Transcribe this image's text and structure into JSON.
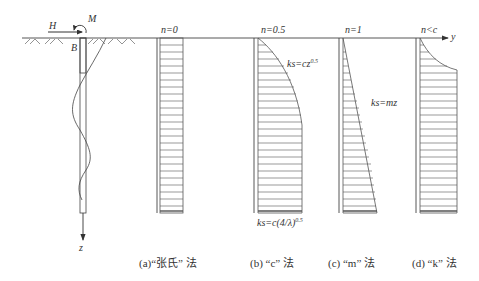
{
  "figure": {
    "type": "pile-soil subgrade reaction distribution diagram",
    "axes": {
      "horizontal": "y",
      "vertical": "z"
    },
    "pile": {
      "load_labels": [
        "H",
        "M"
      ],
      "width_label": "B"
    },
    "panels": [
      {
        "id": "a",
        "n_label": "n=0",
        "distribution": "uniform",
        "caption_prefix": "(a)",
        "caption_name": "“张氏”",
        "caption_suffix": "法"
      },
      {
        "id": "b",
        "n_label": "n=0.5",
        "distribution": "parabolic then constant",
        "formula_top": "ks=cz",
        "formula_top_exp": "0.5",
        "formula_bottom": "ks=c(4/λ)",
        "formula_bottom_exp": "0.5",
        "caption_prefix": "(b)",
        "caption_name": "“c”",
        "caption_suffix": "法"
      },
      {
        "id": "c",
        "n_label": "n=1",
        "distribution": "linear",
        "formula": "ks=mz",
        "caption_prefix": "(c)",
        "caption_name": "“m”",
        "caption_suffix": "法"
      },
      {
        "id": "d",
        "n_label": "n<c",
        "distribution": "curved then constant",
        "caption_prefix": "(d)",
        "caption_name": "“k”",
        "caption_suffix": "法"
      }
    ]
  },
  "colors": {
    "line": "#444444",
    "hatch": "#555555",
    "text": "#333333"
  }
}
